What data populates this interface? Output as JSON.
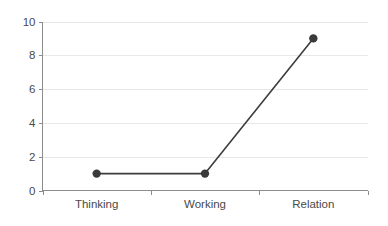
{
  "chart_data": {
    "type": "line",
    "title": "",
    "subtitle": "",
    "xlabel": "",
    "ylabel": "",
    "categories": [
      "Thinking",
      "Working",
      "Relation"
    ],
    "values": [
      1,
      1,
      9
    ],
    "series": [
      {
        "name": "series-1",
        "values": [
          1,
          1,
          9
        ],
        "line_color": "#3c3c3c",
        "marker_color": "#3a3a3a",
        "marker": "circle"
      }
    ],
    "ylim": [
      0,
      10
    ],
    "yticks": [
      0,
      2,
      4,
      6,
      8,
      10
    ],
    "ytick_labels": [
      "0",
      "2",
      "4",
      "6",
      "8",
      "10"
    ],
    "xtick_labels": [
      "Thinking",
      "Working",
      "Relation"
    ],
    "grid": true,
    "grid_axis": "y",
    "grid_color": "#e8e8e8",
    "legend": false,
    "legend_position": "none",
    "background_color": "#ffffff",
    "axis_color": "#8c8c8c",
    "tick_label_color": "#4a4a4a",
    "annotations": []
  },
  "axes": {
    "y_ticks": [
      {
        "value": 10,
        "label": "10"
      },
      {
        "value": 8,
        "label": "8"
      },
      {
        "value": 6,
        "label": "6"
      },
      {
        "value": 4,
        "label": "4"
      },
      {
        "value": 2,
        "label": "2"
      },
      {
        "value": 0,
        "label": "0"
      }
    ],
    "x_ticks": [
      {
        "label": "Thinking"
      },
      {
        "label": "Working"
      },
      {
        "label": "Relation"
      }
    ]
  }
}
